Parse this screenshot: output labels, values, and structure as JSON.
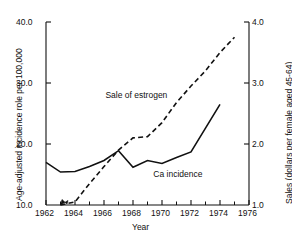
{
  "chart_data": {
    "type": "line",
    "title": "",
    "xlabel": "Year",
    "ylabel_left": "Age-adjusted incidence role per 100,000",
    "ylabel_right": "Sales (dollars per female aged 45-64)",
    "grid": false,
    "legend_position": "inline-annotations",
    "xlim": [
      1962,
      1976
    ],
    "xticks": [
      1962,
      1964,
      1966,
      1968,
      1970,
      1972,
      1974,
      1976
    ],
    "xtick_labels": [
      "1962",
      "1964",
      "1966",
      "1968",
      "1970",
      "1972",
      "1974",
      "1976"
    ],
    "x_minor_ticks": [
      1963,
      1965,
      1967,
      1969,
      1971,
      1973,
      1975
    ],
    "ylim_left": [
      10.0,
      40.0
    ],
    "yticks_left": [
      10.0,
      20.0,
      30.0,
      40.0
    ],
    "ytick_labels_left": [
      "10.0",
      "20.0",
      "30.0",
      "40.0"
    ],
    "ylim_right": [
      1.0,
      4.0
    ],
    "yticks_right": [
      1.0,
      2.0,
      3.0,
      4.0
    ],
    "ytick_labels_right": [
      "1.0",
      "2.0",
      "3.0",
      "4.0"
    ],
    "series": [
      {
        "name": "Ca incidence",
        "axis": "left",
        "style": "solid",
        "annotation": "Ca incidence",
        "x": [
          1962,
          1963,
          1964,
          1965,
          1966,
          1967,
          1968,
          1969,
          1970,
          1971,
          1972,
          1973,
          1974
        ],
        "values": [
          17.0,
          15.4,
          15.5,
          16.3,
          17.3,
          18.9,
          16.2,
          17.3,
          16.8,
          17.8,
          18.7,
          22.6,
          26.5
        ]
      },
      {
        "name": "Sale of estrogen",
        "axis": "right",
        "style": "dashed",
        "annotation": "Sale of estrogen",
        "x": [
          1963,
          1964,
          1965,
          1966,
          1967,
          1968,
          1969,
          1970,
          1971,
          1972,
          1973,
          1974,
          1975
        ],
        "values": [
          1.0,
          1.05,
          1.35,
          1.63,
          1.9,
          2.1,
          2.12,
          2.35,
          2.68,
          2.95,
          3.2,
          3.5,
          3.75
        ]
      }
    ],
    "annotations": [
      {
        "text": "Sale of estrogen",
        "x": 1966.1,
        "y_right": 2.78
      },
      {
        "text": "Ca incidence",
        "x": 1969.4,
        "y_left": 14.9
      }
    ]
  },
  "axis": {
    "x_title": "Year",
    "y_left_title": "Age-adjusted incidence role per 100,000",
    "y_right_title": "Sales (dollars per female aged 45-64)"
  },
  "colors": {
    "ink": "#111111",
    "background": "#ffffff"
  }
}
